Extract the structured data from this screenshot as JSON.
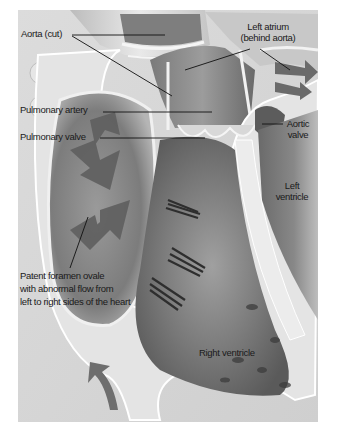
{
  "figure": {
    "labels": {
      "aorta_cut": "Aorta (cut)",
      "left_atrium": [
        "Left atrium",
        "(behind aorta)"
      ],
      "pulmonary_artery": "Pulmonary artery",
      "pulmonary_valve": "Pulmonary valve",
      "aortic_valve": [
        "Aortic",
        "valve"
      ],
      "left_ventricle": [
        "Left",
        "ventricle"
      ],
      "pfo": [
        "Patent foramen ovale",
        "with abnormal flow from",
        "left to right sides of the heart"
      ],
      "right_ventricle": "Right ventricle"
    },
    "colors": {
      "background": "#ffffff",
      "panel": "#d9d9d9",
      "wall_light": "#ececec",
      "chamber_dark": "#7a7a7a",
      "arrow": "#6e6e6e",
      "leader": "#111111"
    }
  }
}
